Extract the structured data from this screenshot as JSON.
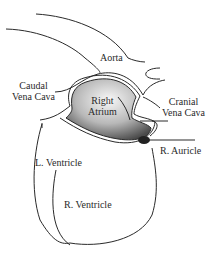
{
  "diagram": {
    "type": "anatomical-heart-illustration",
    "labels": {
      "aorta": "Aorta",
      "caudal_vena_cava": [
        "Caudal",
        "Vena Cava"
      ],
      "right_atrium": [
        "Right",
        "Atrium"
      ],
      "cranial_vena_cava": [
        "Cranial",
        "Vena Cava"
      ],
      "r_auricle": "R. Auricle",
      "l_ventricle": "L. Ventricle",
      "r_ventricle": "R. Ventricle"
    },
    "colors": {
      "outline": "#2a2a2a",
      "atrium_light": "#f4f4f4",
      "atrium_dark": "#555555"
    }
  }
}
